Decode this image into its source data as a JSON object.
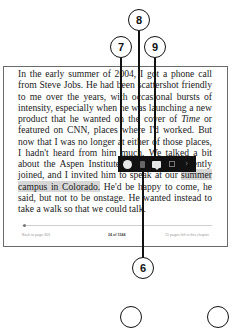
{
  "page": {
    "paragraph_before": "In the early summer of 2004, I got a phone call from Steve Jobs. He had been scattershot friendly to me over the years, with occasional bursts of intensity, especially when he was launching a new product that he wanted on the cover of ",
    "italic_word": "Time",
    "paragraph_mid": " or featured on CNN, places where I'd worked. But now that I was no longer at either of those places, I hadn't heard from him much. We talked a bit about the Aspen Institute, which I had recently joined, and I invited him to speak at our ",
    "highlighted_text": "summer campus in Colorado.",
    "paragraph_after": " He'd be happy to come, he said, but not to be onstage. He wanted instead to take a walk so that we could talk."
  },
  "footer": {
    "back_link": "Back to page 303",
    "location": "24 of 1544",
    "chapter_remaining": "15 pages left in this chapter"
  },
  "toolbar": {
    "icons": [
      "highlight-color-icon",
      "trash-icon",
      "note-icon",
      "share-icon",
      "chevron-right-icon"
    ],
    "chevron_glyph": "›"
  },
  "callouts": {
    "c6": "6",
    "c7": "7",
    "c8": "8",
    "c9": "9"
  },
  "colors": {
    "highlight": "#d6d6d6",
    "toolbar_bg": "#111111"
  }
}
